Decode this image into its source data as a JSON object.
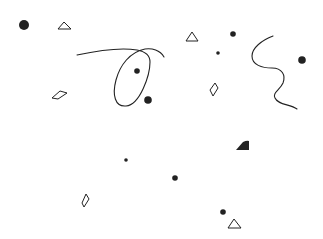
{
  "canvas": {
    "width": 323,
    "height": 239,
    "background": "#ffffff",
    "ink": "#222222"
  },
  "dots": [
    {
      "name": "dot-large-top-left",
      "cx": 24,
      "cy": 25,
      "r": 5
    },
    {
      "name": "dot-inside-loop",
      "cx": 137,
      "cy": 71,
      "r": 2.8
    },
    {
      "name": "dot-below-loop",
      "cx": 148,
      "cy": 100,
      "r": 3.8
    },
    {
      "name": "dot-top-right-a",
      "cx": 233,
      "cy": 34,
      "r": 2.8
    },
    {
      "name": "dot-top-right-small",
      "cx": 218,
      "cy": 53,
      "r": 1.8
    },
    {
      "name": "dot-right-edge",
      "cx": 302,
      "cy": 60,
      "r": 3.8
    },
    {
      "name": "dot-center-small",
      "cx": 126,
      "cy": 160,
      "r": 1.8
    },
    {
      "name": "dot-center",
      "cx": 175,
      "cy": 178,
      "r": 2.8
    },
    {
      "name": "dot-bottom-right",
      "cx": 223,
      "cy": 212,
      "r": 2.8
    }
  ],
  "outline_triangles": [
    {
      "name": "triangle-top-left",
      "points": "58,29 64,22 71,29"
    },
    {
      "name": "triangle-top-right",
      "points": "186,41 192,32 198,41"
    },
    {
      "name": "triangle-bottom-right",
      "points": "228,228 234,219 241,228"
    }
  ],
  "outline_quads": [
    {
      "name": "quad-left",
      "points": "52,98 60,91 67,93 58,99"
    },
    {
      "name": "quad-right",
      "points": "210,90 215,83 218,88 213,96"
    },
    {
      "name": "quad-bottom-left",
      "points": "82,203 86,194 89,199 84,207"
    }
  ],
  "filled_shapes": [
    {
      "name": "filled-wedge",
      "d": "M236,150 L243,142 Q247,140 249,141 L249,150 Z"
    }
  ],
  "curves": [
    {
      "name": "loop-curve",
      "d": "M77,55 C100,50 120,47 137,50 C148,52 150,58 150,62 C150,75 140,105 126,106 C115,107 112,95 116,80 C120,65 130,52 145,49 C152,48 160,50 164,57"
    },
    {
      "name": "wavy-curve",
      "d": "M273,36 C262,40 252,48 252,56 C252,65 262,68 272,68 C282,68 286,75 283,83 C280,90 272,93 275,98 C278,105 290,104 297,109"
    }
  ]
}
